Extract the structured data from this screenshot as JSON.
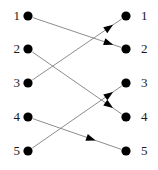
{
  "diagram": {
    "type": "bipartite-permutation-graph",
    "width": 158,
    "height": 170,
    "background_color": "#ffffff",
    "node_color": "#000000",
    "edge_color": "#808080",
    "arrow_color": "#000000",
    "label_color": "#1a1a1a",
    "node_radius": 4.6,
    "left_column": {
      "name": "domain-column",
      "x": 28,
      "nodes": [
        {
          "id": "L1",
          "label": "1",
          "y": 16
        },
        {
          "id": "L2",
          "label": "2",
          "y": 49
        },
        {
          "id": "L3",
          "label": "3",
          "y": 83
        },
        {
          "id": "L4",
          "label": "4",
          "y": 117
        },
        {
          "id": "L5",
          "label": "5",
          "y": 151
        }
      ],
      "label_x": 6
    },
    "right_column": {
      "name": "codomain-column",
      "x": 126,
      "nodes": [
        {
          "id": "R1",
          "label": "1",
          "y": 16
        },
        {
          "id": "R2",
          "label": "2",
          "y": 49
        },
        {
          "id": "R3",
          "label": "3",
          "y": 83
        },
        {
          "id": "R4",
          "label": "4",
          "y": 117
        },
        {
          "id": "R5",
          "label": "5",
          "y": 151
        }
      ],
      "label_x": 141
    },
    "edges": [
      {
        "id": "E1",
        "from": "L1",
        "to": "R2",
        "from_label": "1",
        "to_label": "2",
        "arrow_t": 0.86
      },
      {
        "id": "E2",
        "from": "L2",
        "to": "R4",
        "from_label": "2",
        "to_label": "4",
        "arrow_t": 0.86
      },
      {
        "id": "E3",
        "from": "L3",
        "to": "R1",
        "from_label": "3",
        "to_label": "1",
        "arrow_t": 0.86
      },
      {
        "id": "E4",
        "from": "L4",
        "to": "R5",
        "from_label": "4",
        "to_label": "5",
        "arrow_t": 0.66
      },
      {
        "id": "E5",
        "from": "L5",
        "to": "R3",
        "from_label": "5",
        "to_label": "3",
        "arrow_t": 0.86
      }
    ],
    "permutation": [
      2,
      4,
      1,
      5,
      3
    ]
  }
}
